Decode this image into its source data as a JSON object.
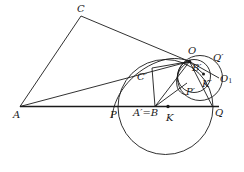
{
  "figure": {
    "background_color": "#ffffff",
    "stroke_color": "#1a1a1a",
    "label_color": "#1a1a1a",
    "width": 244,
    "height": 172
  },
  "labels": [
    {
      "id": "C",
      "text": "C",
      "x": 77,
      "y": 4,
      "sub": ""
    },
    {
      "id": "O",
      "text": "O",
      "x": 188,
      "y": 46,
      "sub": ""
    },
    {
      "id": "Qprime",
      "text": "Q′",
      "x": 213,
      "y": 53,
      "sub": ""
    },
    {
      "id": "Bprime",
      "text": "B′",
      "x": 192,
      "y": 63,
      "sub": ""
    },
    {
      "id": "Cprime",
      "text": "C′",
      "x": 137,
      "y": 72,
      "sub": ""
    },
    {
      "id": "O1",
      "text": "O",
      "x": 220,
      "y": 74,
      "sub": "1"
    },
    {
      "id": "Kprime",
      "text": "K′",
      "x": 202,
      "y": 79,
      "sub": ""
    },
    {
      "id": "Pprime",
      "text": "P′",
      "x": 186,
      "y": 87,
      "sub": ""
    },
    {
      "id": "A",
      "text": "A",
      "x": 13,
      "y": 110,
      "sub": ""
    },
    {
      "id": "P",
      "text": "P",
      "x": 110,
      "y": 110,
      "sub": ""
    },
    {
      "id": "AeqB",
      "text": "A′=B",
      "x": 133,
      "y": 108,
      "sub": ""
    },
    {
      "id": "K",
      "text": "K",
      "x": 166,
      "y": 113,
      "sub": ""
    },
    {
      "id": "Q",
      "text": "Q",
      "x": 215,
      "y": 108,
      "sub": ""
    }
  ],
  "points": [
    {
      "id": "A",
      "x": 20,
      "y": 106.5,
      "dot": false
    },
    {
      "id": "C",
      "x": 81,
      "y": 16,
      "dot": false
    },
    {
      "id": "O",
      "x": 189.5,
      "y": 61.5,
      "dot": true
    },
    {
      "id": "B",
      "x": 155,
      "y": 106.5,
      "dot": false
    },
    {
      "id": "K",
      "x": 168,
      "y": 106.5,
      "dot": true
    },
    {
      "id": "Kp",
      "x": 203.5,
      "y": 74,
      "dot": true
    },
    {
      "id": "Cc",
      "x": 152,
      "y": 68,
      "dot": false
    },
    {
      "id": "P",
      "x": 118,
      "y": 106.5,
      "dot": false
    },
    {
      "id": "Q",
      "x": 212.5,
      "y": 106.5,
      "dot": false
    }
  ],
  "circles": [
    {
      "id": "big-circle",
      "cx": 165.5,
      "cy": 107,
      "r": 47.5,
      "note": "large circle through P and Q"
    },
    {
      "id": "small-circle",
      "cx": 194,
      "cy": 76,
      "r": 16.5,
      "note": "small circle through O with centre K'"
    },
    {
      "id": "medium-circle",
      "cx": 200,
      "cy": 78,
      "r": 22.5,
      "note": "circle through O, Q' and O1"
    }
  ],
  "arcs": [
    {
      "id": "arc-AO-left",
      "note": "large arc from near A region sweeping to O"
    },
    {
      "id": "arc-inner-OP",
      "note": "arc from O curving down to P' area"
    }
  ],
  "segments": [
    {
      "id": "seg-A-C",
      "from": "A",
      "to": "C",
      "note": "triangle side AC"
    },
    {
      "id": "seg-C-O",
      "from": "C",
      "to": "O",
      "note": "triangle side CO"
    },
    {
      "id": "seg-A-O",
      "from": "A",
      "to": "O",
      "note": "line AO"
    },
    {
      "id": "seg-A-Q",
      "from": "A",
      "to": "Q",
      "note": "baseline through P, A'=B, K, Q"
    },
    {
      "id": "seg-B-O",
      "from": "B",
      "to": "O",
      "note": "segment BO"
    },
    {
      "id": "seg-B-Cc",
      "from": "B",
      "to": "Cc",
      "note": "vertical segment B to C' corner"
    },
    {
      "id": "seg-Cc-O",
      "from": "Cc",
      "to": "O",
      "note": "segment C' corner to O"
    },
    {
      "id": "seg-B-Pp",
      "from": "B",
      "to": "Pp",
      "note": "segment B to P' direction"
    },
    {
      "id": "seg-O-Kp",
      "from": "O",
      "to": "Kp",
      "note": "segment O to K'"
    },
    {
      "id": "seg-O-O1",
      "from": "O",
      "to": "O1",
      "note": "segment O to O1"
    },
    {
      "id": "seg-O-Q",
      "from": "O",
      "to": "Q",
      "note": "segment O to Q"
    }
  ]
}
